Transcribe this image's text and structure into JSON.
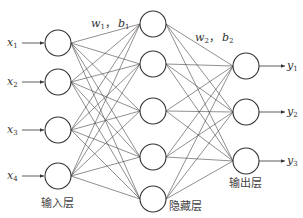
{
  "diagram": {
    "title": "",
    "layers": [
      {
        "name": "input",
        "label": "输入层",
        "nodes": 4,
        "inputs": [
          {
            "base": "x",
            "sub": "1"
          },
          {
            "base": "x",
            "sub": "2"
          },
          {
            "base": "x",
            "sub": "3"
          },
          {
            "base": "x",
            "sub": "4"
          }
        ]
      },
      {
        "name": "hidden",
        "label": "隐藏层",
        "nodes": 5
      },
      {
        "name": "output",
        "label": "输出层",
        "nodes": 3,
        "outputs": [
          {
            "base": "y",
            "sub": "1"
          },
          {
            "base": "y",
            "sub": "2"
          },
          {
            "base": "y",
            "sub": "3"
          }
        ]
      }
    ],
    "weights": [
      {
        "text": "w",
        "sub": "1",
        "sep": "，",
        "bias": "b",
        "bias_sub": "1"
      },
      {
        "text": "w",
        "sub": "2",
        "sep": "，",
        "bias": "b",
        "bias_sub": "2"
      }
    ],
    "connectivity": "fully-connected"
  }
}
